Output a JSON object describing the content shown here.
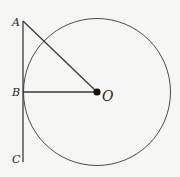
{
  "diagram": {
    "type": "geometry",
    "points": {
      "A": {
        "label": "A",
        "x": 23,
        "y": 21
      },
      "B": {
        "label": "B",
        "x": 23,
        "y": 92
      },
      "C": {
        "label": "C",
        "x": 23,
        "y": 162
      },
      "O": {
        "label": "O",
        "x": 97,
        "y": 92
      }
    },
    "circle": {
      "center": "O",
      "radius": 74
    },
    "segments": [
      [
        "A",
        "C"
      ],
      [
        "A",
        "O"
      ],
      [
        "B",
        "O"
      ]
    ],
    "colors": {
      "stroke": "#3a3a3a",
      "background": "#f6f6f4",
      "text": "#1e1e1e"
    }
  }
}
